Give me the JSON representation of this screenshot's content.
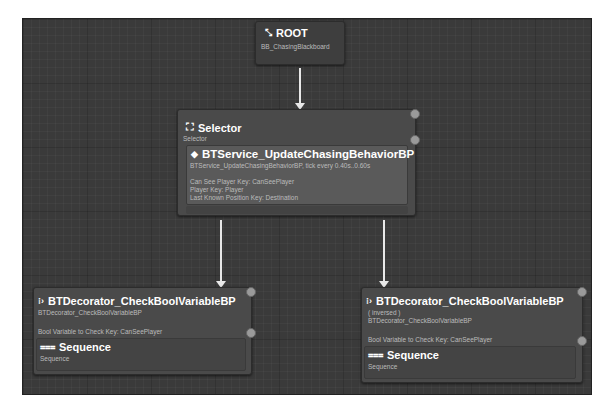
{
  "root": {
    "title": "ROOT",
    "subtitle": "BB_ChasingBlackboard",
    "icon": "root-icon"
  },
  "selector": {
    "title": "Selector",
    "subtitle": "Selector",
    "icon": "selector-icon",
    "service": {
      "title": "BTService_UpdateChasingBehaviorBP",
      "icon": "service-icon",
      "tick": "BTService_UpdateChasingBehaviorBP, tick every 0.40s..0.60s",
      "lines": [
        "Can See Player Key: CanSeePlayer",
        "Player Key: Player",
        "Last Known Position Key: Destination"
      ]
    }
  },
  "left_branch": {
    "decorator": {
      "title": "BTDecorator_CheckBoolVariableBP",
      "icon": "decorator-icon",
      "subtitle": "BTDecorator_CheckBoolVariableBP",
      "key_line": "Bool Variable to Check Key: CanSeePlayer"
    },
    "sequence": {
      "title": "Sequence",
      "subtitle": "Sequence",
      "icon": "sequence-icon"
    }
  },
  "right_branch": {
    "decorator": {
      "title": "BTDecorator_CheckBoolVariableBP",
      "icon": "decorator-icon",
      "inversed": "( inversed )",
      "subtitle": "BTDecorator_CheckBoolVariableBP",
      "key_line": "Bool Variable to Check Key: CanSeePlayer"
    },
    "sequence": {
      "title": "Sequence",
      "subtitle": "Sequence",
      "icon": "sequence-icon"
    }
  }
}
